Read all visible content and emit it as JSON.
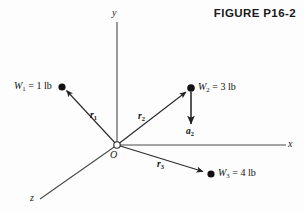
{
  "figure": {
    "title": "FIGURE P16-2",
    "background_color": "#fdfdfd",
    "line_color": "#333333",
    "marker_color": "#111111",
    "width": 304,
    "height": 212
  },
  "axes": {
    "y_label": "y",
    "x_label": "x",
    "z_label": "z",
    "origin_label": "O"
  },
  "vectors": [
    {
      "name": "r1",
      "label_base": "r",
      "label_sub": "1"
    },
    {
      "name": "r2",
      "label_base": "r",
      "label_sub": "2"
    },
    {
      "name": "r3",
      "label_base": "r",
      "label_sub": "3"
    },
    {
      "name": "a2",
      "label_base": "a",
      "label_sub": "2"
    }
  ],
  "masses": [
    {
      "name": "W1",
      "symbol": "W",
      "subscript": "1",
      "equals": " = ",
      "value": "1",
      "unit": "lb",
      "text": "W1 = 1 lb"
    },
    {
      "name": "W2",
      "symbol": "W",
      "subscript": "2",
      "equals": " = ",
      "value": "3",
      "unit": "lb",
      "text": "W2 = 3 lb"
    },
    {
      "name": "W3",
      "symbol": "W",
      "subscript": "3",
      "equals": " = ",
      "value": "4",
      "unit": "lb",
      "text": "W3 = 4 lb"
    }
  ],
  "labels": {
    "w1_sym": "W",
    "w1_sub": "1",
    "w1_rest": " = 1 lb",
    "w2_sym": "W",
    "w2_sub": "2",
    "w2_rest": " = 3 lb",
    "w3_sym": "W",
    "w3_sub": "3",
    "w3_rest": " = 4 lb",
    "r1_sym": "r",
    "r1_sub": "1",
    "r2_sym": "r",
    "r2_sub": "2",
    "r3_sym": "r",
    "r3_sub": "3",
    "a2_sym": "a",
    "a2_sub": "2"
  }
}
